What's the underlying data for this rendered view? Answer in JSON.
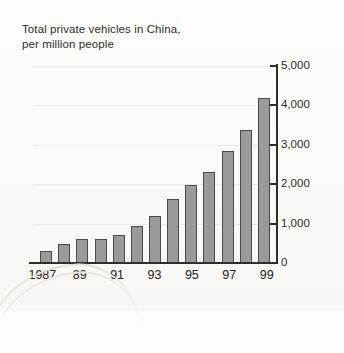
{
  "chart_data": {
    "type": "bar",
    "title": "Total private vehicles in China,\nper million people",
    "xlabel": "",
    "ylabel": "",
    "grid": true,
    "legend": "none",
    "ylim": [
      0,
      5000
    ],
    "yticks": [
      0,
      1000,
      2000,
      3000,
      4000,
      5000
    ],
    "ytick_labels": [
      "0",
      "1,000",
      "2,000",
      "3,000",
      "4,000",
      "5,000"
    ],
    "categories": [
      "1987",
      "1988",
      "1989",
      "1990",
      "1991",
      "1992",
      "1993",
      "1994",
      "1995",
      "1996",
      "1997",
      "1998",
      "1999"
    ],
    "xtick_labels": [
      "1987",
      "89",
      "91",
      "93",
      "95",
      "97",
      "99"
    ],
    "xtick_categories": [
      "1987",
      "1989",
      "1991",
      "1993",
      "1995",
      "1997",
      "1999"
    ],
    "values": [
      300,
      480,
      600,
      610,
      720,
      950,
      1200,
      1620,
      1980,
      2300,
      2850,
      3380,
      4180
    ],
    "bar_color": "#9a9a9a",
    "bar_edge_color": "#4a4a4a",
    "axis_color": "#2e2e2e",
    "grid_color": "#ece9e2",
    "background_color": "#fcfbf8",
    "text_color": "#2b2b2b"
  }
}
